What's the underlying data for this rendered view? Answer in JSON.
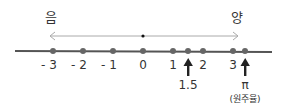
{
  "labels": {
    "negative": "음",
    "positive": "양"
  },
  "ticks": [
    {
      "value": -3,
      "label": "- 3"
    },
    {
      "value": -2,
      "label": "- 2"
    },
    {
      "value": -1,
      "label": "- 1"
    },
    {
      "value": 0,
      "label": "0"
    },
    {
      "value": 1,
      "label": "1"
    },
    {
      "value": 1.5,
      "label": ""
    },
    {
      "value": 2,
      "label": "2"
    },
    {
      "value": 3,
      "label": "3"
    },
    {
      "value": 3.14,
      "label": ""
    }
  ],
  "markers": [
    {
      "value": 1.5,
      "label": "1.5",
      "sublabel": ""
    },
    {
      "value": 3.14,
      "label": "π",
      "sublabel": "(원주율)"
    }
  ],
  "colors": {
    "line": "#555555",
    "point": "#666666",
    "arrow": "#aaaaaa",
    "marker": "#222222"
  }
}
